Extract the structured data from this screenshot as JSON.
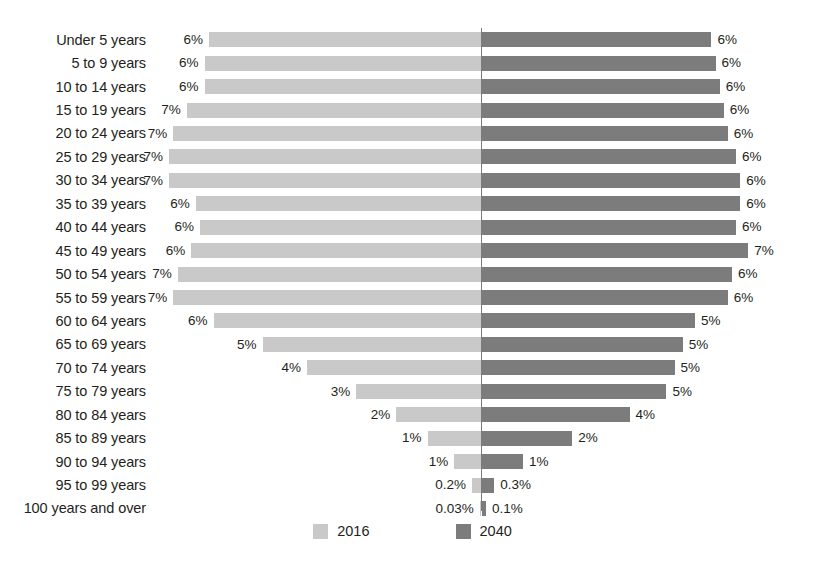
{
  "chart_data": {
    "type": "bar",
    "subtype": "population-pyramid",
    "title": "",
    "xlabel": "",
    "ylabel": "",
    "orientation": "horizontal",
    "grid": false,
    "legend_position": "bottom-center",
    "axis_center_label": "0%",
    "xlim": [
      0,
      7.2
    ],
    "colors": {
      "series_2016": "#c9c9c9",
      "series_2040": "#7c7c7c",
      "axis": "#7b7b7b",
      "text": "#231f20",
      "background": "#ffffff"
    },
    "categories": [
      "Under 5 years",
      "5 to 9 years",
      "10 to 14 years",
      "15 to 19 years",
      "20 to 24 years",
      "25 to 29 years",
      "30 to 34 years",
      "35 to 39 years",
      "40 to 44 years",
      "45 to 49 years",
      "50 to 54 years",
      "55 to 59 years",
      "60 to 64 years",
      "65 to 69 years",
      "70 to 74 years",
      "75 to 79 years",
      "80 to 84 years",
      "85 to 89 years",
      "90 to 94 years",
      "95 to 99 years",
      "100 years and over"
    ],
    "series": [
      {
        "name": "2016",
        "side": "left",
        "color": "#c9c9c9",
        "values": [
          6.1,
          6.2,
          6.2,
          6.6,
          6.9,
          7.0,
          7.0,
          6.4,
          6.3,
          6.5,
          6.8,
          6.9,
          6.0,
          4.9,
          3.9,
          2.8,
          1.9,
          1.2,
          0.6,
          0.2,
          0.03
        ],
        "labels": [
          "6%",
          "6%",
          "6%",
          "7%",
          "7%",
          "7%",
          "7%",
          "6%",
          "6%",
          "6%",
          "7%",
          "7%",
          "6%",
          "5%",
          "4%",
          "3%",
          "2%",
          "1%",
          "1%",
          "0.2%",
          "0.03%"
        ]
      },
      {
        "name": "2040",
        "side": "right",
        "color": "#7c7c7c",
        "values": [
          5.6,
          5.7,
          5.8,
          5.9,
          6.0,
          6.2,
          6.3,
          6.3,
          6.2,
          6.5,
          6.1,
          6.0,
          5.2,
          4.9,
          4.7,
          4.5,
          3.6,
          2.2,
          1.0,
          0.3,
          0.1
        ],
        "labels": [
          "6%",
          "6%",
          "6%",
          "6%",
          "6%",
          "6%",
          "6%",
          "6%",
          "6%",
          "7%",
          "6%",
          "6%",
          "5%",
          "5%",
          "5%",
          "5%",
          "4%",
          "2%",
          "1%",
          "0.3%",
          "0.1%"
        ]
      }
    ],
    "legend": [
      {
        "label": "2016",
        "color": "#c9c9c9",
        "icon": "legend-swatch"
      },
      {
        "label": "2040",
        "color": "#7c7c7c",
        "icon": "legend-swatch"
      }
    ]
  }
}
